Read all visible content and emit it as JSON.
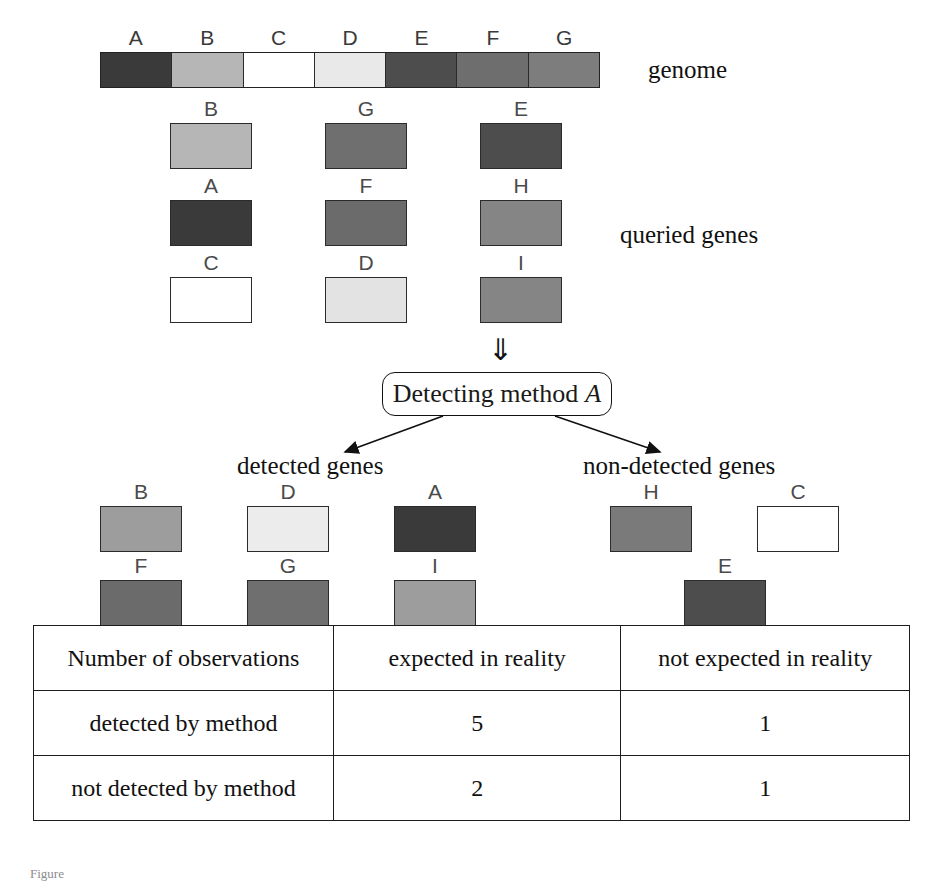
{
  "figure": {
    "caption_fragment": "Figure"
  },
  "genome": {
    "label": "genome",
    "segments": [
      {
        "id": "A",
        "color": "#3a3a3a"
      },
      {
        "id": "B",
        "color": "#b6b6b6"
      },
      {
        "id": "C",
        "color": "#ffffff"
      },
      {
        "id": "D",
        "color": "#e9e9e9"
      },
      {
        "id": "E",
        "color": "#4d4d4d"
      },
      {
        "id": "F",
        "color": "#6e6e6e"
      },
      {
        "id": "G",
        "color": "#7d7d7d"
      }
    ]
  },
  "queried": {
    "label": "queried genes",
    "rows": [
      [
        {
          "id": "B",
          "color": "#b6b6b6"
        },
        {
          "id": "G",
          "color": "#6f6f6f"
        },
        {
          "id": "E",
          "color": "#4d4d4d"
        }
      ],
      [
        {
          "id": "A",
          "color": "#3a3a3a"
        },
        {
          "id": "F",
          "color": "#6b6b6b"
        },
        {
          "id": "H",
          "color": "#858585"
        }
      ],
      [
        {
          "id": "C",
          "color": "#ffffff"
        },
        {
          "id": "D",
          "color": "#e3e3e3"
        },
        {
          "id": "I",
          "color": "#858585"
        }
      ]
    ]
  },
  "method": {
    "prefix": "Detecting method",
    "name": "A",
    "input_arrow": "⇓"
  },
  "results": {
    "detected_header": "detected genes",
    "non_detected_header": "non-detected genes",
    "detected": [
      [
        {
          "id": "B",
          "color": "#9d9d9d"
        },
        {
          "id": "D",
          "color": "#ececec"
        },
        {
          "id": "A",
          "color": "#3a3a3a"
        }
      ],
      [
        {
          "id": "F",
          "color": "#6b6b6b"
        },
        {
          "id": "G",
          "color": "#6f6f6f"
        },
        {
          "id": "I",
          "color": "#9d9d9d"
        }
      ]
    ],
    "non_detected": [
      [
        {
          "id": "H",
          "color": "#7a7a7a"
        },
        {
          "id": "C",
          "color": "#ffffff"
        }
      ],
      [
        {
          "id": "E",
          "color": "#4d4d4d"
        }
      ]
    ]
  },
  "table": {
    "headers": [
      "Number of observations",
      "expected in reality",
      "not expected in reality"
    ],
    "rows": [
      {
        "label": "detected by method",
        "expected": "5",
        "not_expected": "1"
      },
      {
        "label": "not detected by method",
        "expected": "2",
        "not_expected": "1"
      }
    ]
  }
}
